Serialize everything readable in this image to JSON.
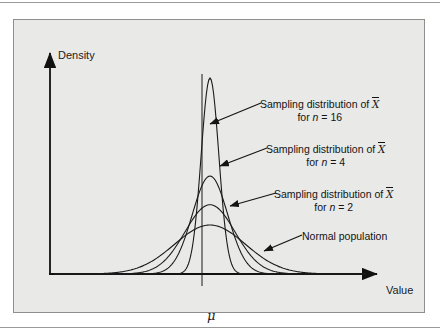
{
  "figure": {
    "panel_background": "#e9e9e7",
    "panel_border": "#8e8e8c",
    "curve_color": "#1b1b1b",
    "axis_color": "#111111",
    "axes": {
      "ylabel": "Density",
      "xlabel": "Value",
      "center_tick_label": "μ"
    },
    "callouts": [
      {
        "name": "n16",
        "line1_prefix": "Sampling distribution of ",
        "line1_symbol": "X",
        "line2_prefix": "for ",
        "line2_var": "n",
        "line2_value": " = 16"
      },
      {
        "name": "n4",
        "line1_prefix": "Sampling distribution of ",
        "line1_symbol": "X",
        "line2_prefix": "for ",
        "line2_var": "n",
        "line2_value": " = 4"
      },
      {
        "name": "n2",
        "line1_prefix": "Sampling distribution of ",
        "line1_symbol": "X",
        "line2_prefix": "for ",
        "line2_var": "n",
        "line2_value": " = 2"
      },
      {
        "name": "population",
        "line1_prefix": "Normal population",
        "line1_symbol": "",
        "line2_prefix": "",
        "line2_var": "",
        "line2_value": ""
      }
    ]
  },
  "chart_data": {
    "type": "line",
    "title": "",
    "subtitle": "",
    "xlabel": "Value",
    "ylabel": "Density",
    "grid": false,
    "legend_position": "annotations",
    "mean": 0,
    "population_sd": 1,
    "x": [
      -4,
      -3.5,
      -3,
      -2.5,
      -2,
      -1.5,
      -1,
      -0.5,
      0,
      0.5,
      1,
      1.5,
      2,
      2.5,
      3,
      3.5,
      4
    ],
    "xlim": [
      -4.4,
      4.4
    ],
    "ylim": [
      0,
      1.75
    ],
    "annotations": [
      "Sampling distribution of X̄ for n = 16",
      "Sampling distribution of X̄ for n = 4",
      "Sampling distribution of X̄ for n = 2",
      "Normal population",
      "μ"
    ],
    "series": [
      {
        "name": "Normal population",
        "n": 1,
        "sd": 1,
        "peak_density": 0.399,
        "values": [
          0.0001,
          0.0009,
          0.0044,
          0.0175,
          0.054,
          0.1295,
          0.242,
          0.3521,
          0.3989,
          0.3521,
          0.242,
          0.1295,
          0.054,
          0.0175,
          0.0044,
          0.0009,
          0.0001
        ]
      },
      {
        "name": "Sampling distribution of X̄ for n = 2",
        "n": 2,
        "sd": 0.7071,
        "peak_density": 0.564,
        "values": [
          0.0,
          0.0001,
          0.0015,
          0.0108,
          0.0568,
          0.2186,
          0.6132,
          1.2505,
          0.5642,
          1.2505,
          0.6132,
          0.2186,
          0.0568,
          0.0108,
          0.0015,
          0.0001,
          0.0
        ]
      },
      {
        "name": "Sampling distribution of X̄ for n = 4",
        "n": 4,
        "sd": 0.5,
        "peak_density": 0.798,
        "values": [
          0.0,
          0.0,
          0.0,
          0.0001,
          0.0027,
          0.0355,
          0.216,
          0.4839,
          0.7979,
          0.4839,
          0.216,
          0.0355,
          0.0027,
          0.0001,
          0.0,
          0.0,
          0.0
        ]
      },
      {
        "name": "Sampling distribution of X̄ for n = 16",
        "n": 16,
        "sd": 0.25,
        "peak_density": 1.596,
        "values": [
          0.0,
          0.0,
          0.0,
          0.0,
          0.0,
          0.0,
          0.0234,
          0.4318,
          1.5958,
          0.4318,
          0.0234,
          0.0,
          0.0,
          0.0,
          0.0,
          0.0,
          0.0
        ]
      }
    ]
  }
}
